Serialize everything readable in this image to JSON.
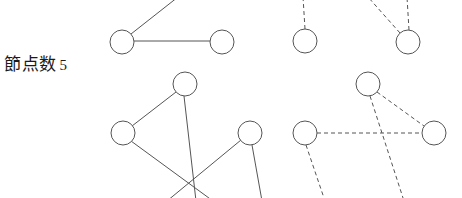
{
  "figure": {
    "width": 462,
    "height": 198,
    "background": "#ffffff",
    "stroke_color": "#555555",
    "node_fill": "#ffffff",
    "text_color": "#1a1a1a"
  },
  "caption": {
    "text": "節点数",
    "count": "5",
    "full": "節点数 5"
  },
  "panels": [
    {
      "name": "top-left-solid-graph",
      "edge_style": "solid",
      "nodes": [
        {
          "id": "tl-n1",
          "cx": 122,
          "cy": 42,
          "r": 12
        },
        {
          "id": "tl-n2",
          "cx": 222,
          "cy": 42,
          "r": 12
        }
      ],
      "edges": [
        {
          "x1": 134,
          "y1": 41,
          "x2": 210,
          "y2": 41
        },
        {
          "x1": 131,
          "y1": 34,
          "x2": 178,
          "y2": -3
        }
      ]
    },
    {
      "name": "top-right-dashed-graph",
      "edge_style": "dashed",
      "nodes": [
        {
          "id": "tr-n1",
          "cx": 305,
          "cy": 41,
          "r": 12
        },
        {
          "id": "tr-n2",
          "cx": 408,
          "cy": 42,
          "r": 12
        }
      ],
      "edges": [
        {
          "x1": 305,
          "y1": 29,
          "x2": 303,
          "y2": -3
        },
        {
          "x1": 400,
          "y1": 33,
          "x2": 368,
          "y2": -3
        },
        {
          "x1": 409,
          "y1": 30,
          "x2": 407,
          "y2": -3
        }
      ]
    },
    {
      "name": "bottom-left-solid-graph",
      "edge_style": "solid",
      "nodes": [
        {
          "id": "bl-n1",
          "cx": 185,
          "cy": 84,
          "r": 12
        },
        {
          "id": "bl-n2",
          "cx": 123,
          "cy": 133,
          "r": 12
        },
        {
          "id": "bl-n3",
          "cx": 250,
          "cy": 133,
          "r": 12
        }
      ],
      "edges": [
        {
          "x1": 176,
          "y1": 92,
          "x2": 132,
          "y2": 126
        },
        {
          "x1": 184,
          "y1": 96,
          "x2": 196,
          "y2": 201
        },
        {
          "x1": 131,
          "y1": 141,
          "x2": 213,
          "y2": 201
        },
        {
          "x1": 241,
          "y1": 140,
          "x2": 167,
          "y2": 201
        },
        {
          "x1": 252,
          "y1": 145,
          "x2": 262,
          "y2": 201
        }
      ]
    },
    {
      "name": "bottom-right-dashed-graph",
      "edge_style": "dashed",
      "nodes": [
        {
          "id": "br-n1",
          "cx": 368,
          "cy": 84,
          "r": 12
        },
        {
          "id": "br-n2",
          "cx": 305,
          "cy": 133,
          "r": 12
        },
        {
          "id": "br-n3",
          "cx": 434,
          "cy": 133,
          "r": 12
        }
      ],
      "edges": [
        {
          "x1": 317,
          "y1": 133,
          "x2": 422,
          "y2": 133
        },
        {
          "x1": 377,
          "y1": 92,
          "x2": 424,
          "y2": 126
        },
        {
          "x1": 370,
          "y1": 96,
          "x2": 404,
          "y2": 201
        },
        {
          "x1": 306,
          "y1": 145,
          "x2": 325,
          "y2": 201
        }
      ]
    }
  ]
}
